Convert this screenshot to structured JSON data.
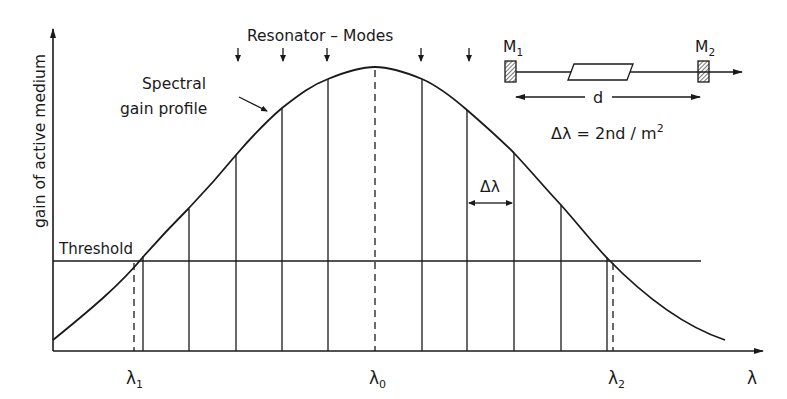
{
  "figure": {
    "y_axis_label": "gain of active medium",
    "x_axis_label": "λ",
    "threshold_label": "Threshold",
    "curve_label_line1": "Spectral",
    "curve_label_line2": "gain profile",
    "modes_label": "Resonator – Modes",
    "delta_lambda_label": "Δλ",
    "lambda_1": "λ",
    "lambda_1_sub": "1",
    "lambda_0": "λ",
    "lambda_0_sub": "0",
    "lambda_2": "λ",
    "lambda_2_sub": "2"
  },
  "resonator": {
    "mirror_1": "M",
    "mirror_1_sub": "1",
    "mirror_2": "M",
    "mirror_2_sub": "2",
    "length_label": "d",
    "formula_main": "Δλ = 2nd / m",
    "formula_sup": "2"
  },
  "colors": {
    "ink": "#1a1a1a",
    "background": "#ffffff"
  }
}
